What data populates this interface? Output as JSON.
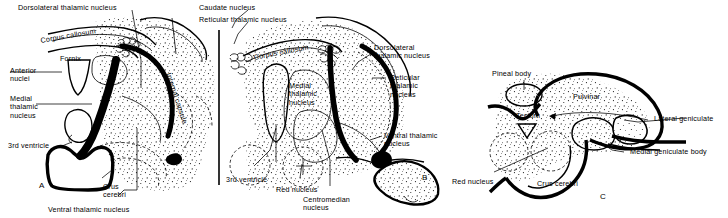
{
  "figure": {
    "background_color": "#ffffff",
    "ink_color": "#000000"
  },
  "panels": [
    {
      "id": "A",
      "letter": "A",
      "labels": [
        {
          "name": "dorsolateral-thalamic-nucleus",
          "text": "Dorsolateral thalamic nucleus"
        },
        {
          "name": "corpus-callosum",
          "text": "Corpus callosum"
        },
        {
          "name": "fornix",
          "text": "Fornix"
        },
        {
          "name": "anterior-nuclei",
          "text": "Anterior\nnuclei"
        },
        {
          "name": "medial-thalamic-nucleus",
          "text": "Medial\nthalamic\nnucleus"
        },
        {
          "name": "third-ventricle",
          "text": "3rd ventricle"
        },
        {
          "name": "crus-cerebri",
          "text": "Crus\ncerebri"
        },
        {
          "name": "internal-capsule",
          "text": "Internal capsule"
        },
        {
          "name": "ventral-thalamic-nucleus",
          "text": "Ventral thalamic nucleus"
        }
      ]
    },
    {
      "id": "B",
      "letter": "B",
      "labels": [
        {
          "name": "caudate-nucleus",
          "text": "Caudate nucleus"
        },
        {
          "name": "reticular-thalamic-nucleus-top",
          "text": "Reticular thalamic nucleus"
        },
        {
          "name": "corpus-callosum",
          "text": "Corpus callosum"
        },
        {
          "name": "dorsolateral-thalamic-nucleus",
          "text": "Dorsolateral\nthalamic nucleus"
        },
        {
          "name": "medial-thalamic-nucleus",
          "text": "Medial\nthalamic\nnucleus"
        },
        {
          "name": "reticular-thalamic-nucleus",
          "text": "Reticular\nthalamic\nnucleus"
        },
        {
          "name": "ventral-thalamic-nucleus",
          "text": "Ventral thalamic\nnucleus"
        },
        {
          "name": "third-ventricle",
          "text": "3rd ventricle"
        },
        {
          "name": "red-nucleus",
          "text": "Red nucleus"
        },
        {
          "name": "centromedian-nucleus",
          "text": "Centromedian\nnucleus"
        }
      ]
    },
    {
      "id": "C",
      "letter": "C",
      "labels": [
        {
          "name": "pineal-body",
          "text": "Pineal body"
        },
        {
          "name": "pulvinar",
          "text": "Pulvinar"
        },
        {
          "name": "tectum",
          "text": "Tectum"
        },
        {
          "name": "lateral-geniculate",
          "text": "Lateral geniculate"
        },
        {
          "name": "medial-geniculate-body",
          "text": "Medial geniculate body"
        },
        {
          "name": "red-nucleus",
          "text": "Red nucleus"
        },
        {
          "name": "crus-cerebri",
          "text": "Crus cerebri"
        }
      ]
    }
  ]
}
